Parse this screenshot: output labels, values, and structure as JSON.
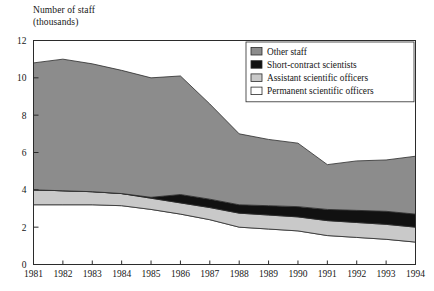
{
  "chart_data": {
    "type": "area",
    "ylabel": "Number of staff (thousands)",
    "xlabel": "",
    "stacked": true,
    "grid": false,
    "legend_position": "top-right-inside",
    "ylim": [
      0,
      12
    ],
    "ytick_values": [
      0,
      2,
      4,
      6,
      8,
      10,
      12
    ],
    "ytick_labels": [
      "0",
      "2",
      "4",
      "6",
      "8",
      "10",
      "12"
    ],
    "x": [
      1981,
      1982,
      1983,
      1984,
      1985,
      1986,
      1987,
      1988,
      1989,
      1990,
      1991,
      1992,
      1993,
      1994
    ],
    "xtick_labels": [
      "1981",
      "1982",
      "1983",
      "1984",
      "1985",
      "1986",
      "1987",
      "1988",
      "1989",
      "1990",
      "1991",
      "1992",
      "1993",
      "1994"
    ],
    "series": [
      {
        "name": "Permanent scientific officers",
        "color": "#ffffff",
        "values": [
          3.2,
          3.2,
          3.2,
          3.15,
          2.95,
          2.7,
          2.4,
          2.0,
          1.9,
          1.8,
          1.55,
          1.45,
          1.35,
          1.2
        ]
      },
      {
        "name": "Assistant scientific officers",
        "color": "#c9c9c9",
        "values": [
          0.8,
          0.75,
          0.7,
          0.65,
          0.6,
          0.6,
          0.65,
          0.75,
          0.75,
          0.75,
          0.8,
          0.8,
          0.8,
          0.8
        ]
      },
      {
        "name": "Short-contract scientists",
        "color": "#111111",
        "values": [
          0.0,
          0.0,
          0.0,
          0.0,
          0.05,
          0.45,
          0.45,
          0.45,
          0.5,
          0.55,
          0.6,
          0.65,
          0.7,
          0.7
        ]
      },
      {
        "name": "Other staff",
        "color": "#8c8c8c",
        "values": [
          6.8,
          7.05,
          6.85,
          6.6,
          6.4,
          6.35,
          5.1,
          3.8,
          3.55,
          3.4,
          2.4,
          2.65,
          2.75,
          3.1
        ]
      }
    ],
    "totals": [
      10.8,
      11.0,
      10.75,
      10.4,
      10.0,
      10.1,
      8.6,
      7.0,
      6.7,
      6.5,
      5.35,
      5.55,
      5.6,
      5.8
    ],
    "legend_entries": [
      {
        "label": "Other staff",
        "swatch": "#8c8c8c"
      },
      {
        "label": "Short-contract scientists",
        "swatch": "#111111"
      },
      {
        "label": "Assistant scientific officers",
        "swatch": "#c9c9c9"
      },
      {
        "label": "Permanent scientific officers",
        "swatch": "#ffffff"
      }
    ]
  },
  "axis": {
    "y_title_line1": "Number of staff",
    "y_title_line2": "(thousands)"
  }
}
